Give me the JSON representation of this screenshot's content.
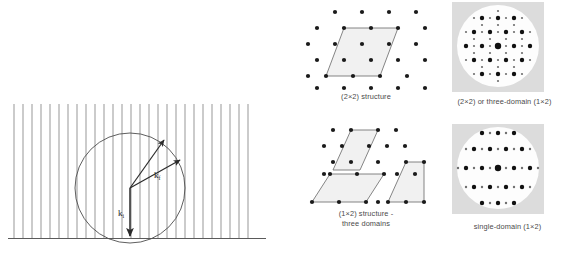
{
  "figure": {
    "stroke_color": "#4d4d4d",
    "dot_color": "#1a1a1a",
    "cell_fill": "#f2f2f2",
    "screen_bg": "#d9d9d9",
    "screen_face": "#fdfdfd"
  },
  "ewald": {
    "name": "ewald-sphere-construction",
    "rod_count": 27,
    "rod_spacing_px": 9,
    "labels": {
      "k_final": "k",
      "k_final_sub": "f",
      "k_incident": "k",
      "k_incident_sub": "i"
    }
  },
  "panels": [
    {
      "id": "structure-2x2",
      "caption": "(2×2) structure",
      "lattice": "hexagonal",
      "cell": "(2×2)",
      "domains": 1
    },
    {
      "id": "leed-2x2",
      "caption": "(2×2) or three-domain (1×2)",
      "pattern": "hexagonal with half-order spots"
    },
    {
      "id": "structure-1x2",
      "caption": "(1×2) structure -\nthree domains",
      "lattice": "hexagonal",
      "cell": "(1×2)",
      "domains": 3
    },
    {
      "id": "leed-1x2",
      "caption": "single-domain (1×2)",
      "pattern": "half-order spots along one direction"
    }
  ]
}
